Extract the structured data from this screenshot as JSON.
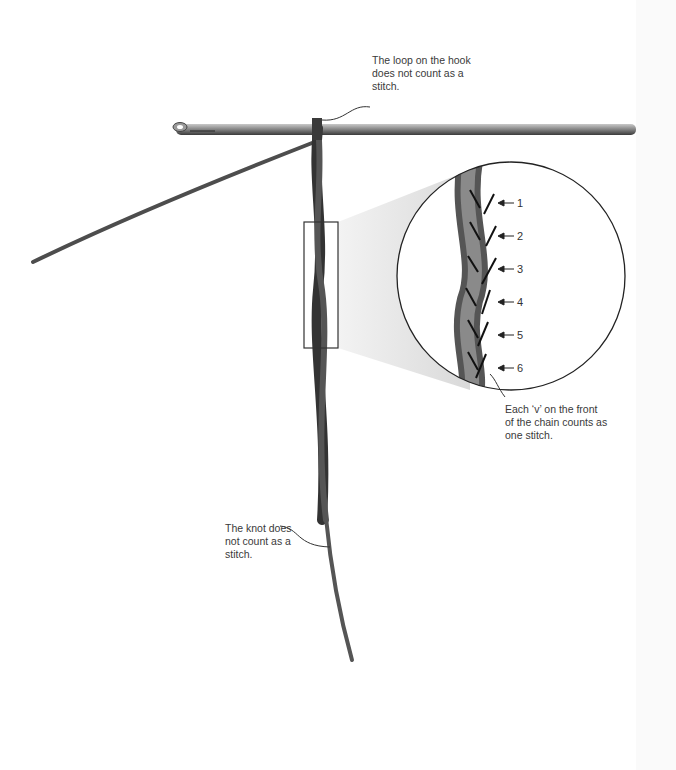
{
  "figure": {
    "annotations": {
      "loop_on_hook": "The loop on the hook\ndoes not count as a\nstitch.",
      "each_v": "Each ‘v’ on the front\nof the chain counts as\none stitch.",
      "knot": "The knot does\nnot count as a\nstitch."
    },
    "stitch_numbers": [
      "1",
      "2",
      "3",
      "4",
      "5",
      "6"
    ],
    "colors": {
      "yarn": "#3d3d3d",
      "yarn_light": "#7a7a7a",
      "hook": "#6e6e6e",
      "magnifier_outline": "#222222",
      "zoom_cone": "#e6e6e6",
      "text": "#3a3a3a"
    }
  }
}
